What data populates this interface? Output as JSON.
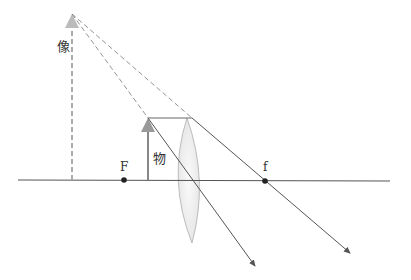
{
  "diagram": {
    "labels": {
      "image": "像",
      "object": "物",
      "focus_left": "F",
      "focus_right": "f"
    },
    "colors": {
      "axis": "#555555",
      "ray": "#555555",
      "object_arrow": "#888888",
      "image_arrow": "#aaaaaa",
      "lens_fill": "#f0f0f0",
      "lens_stroke": "#bbbbbb",
      "focus_point": "#222222"
    }
  }
}
